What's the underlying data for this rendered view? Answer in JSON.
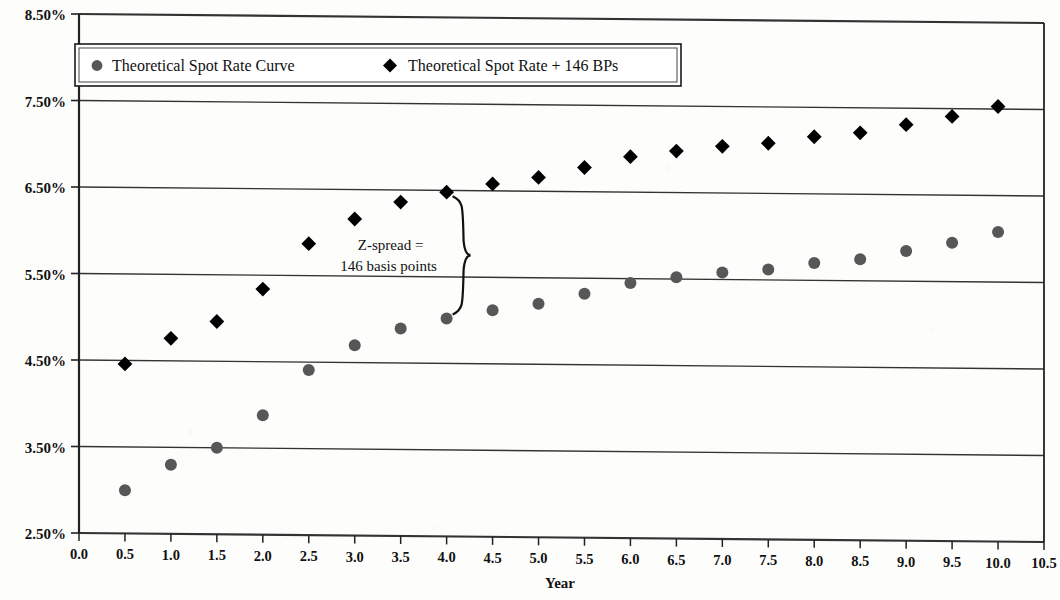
{
  "chart_data": {
    "type": "scatter",
    "title": "",
    "xlabel": "Year",
    "ylabel": "",
    "xlim": [
      0.0,
      10.5
    ],
    "ylim": [
      2.5,
      8.5
    ],
    "grid": true,
    "legend_position": "top-left-inside",
    "x": [
      0.5,
      1.0,
      1.5,
      2.0,
      2.5,
      3.0,
      3.5,
      4.0,
      4.5,
      5.0,
      5.5,
      6.0,
      6.5,
      7.0,
      7.5,
      8.0,
      8.5,
      9.0,
      9.5,
      10.0
    ],
    "x_tick_labels": [
      "0.0",
      "0.5",
      "1.0",
      "1.5",
      "2.0",
      "2.5",
      "3.0",
      "3.5",
      "4.0",
      "4.5",
      "5.0",
      "5.5",
      "6.0",
      "6.5",
      "7.0",
      "7.5",
      "8.0",
      "8.5",
      "9.0",
      "9.5",
      "10.0",
      "10.5"
    ],
    "x_ticks": [
      0.0,
      0.5,
      1.0,
      1.5,
      2.0,
      2.5,
      3.0,
      3.5,
      4.0,
      4.5,
      5.0,
      5.5,
      6.0,
      6.5,
      7.0,
      7.5,
      8.0,
      8.5,
      9.0,
      9.5,
      10.0,
      10.5
    ],
    "y_tick_labels": [
      "8.50%",
      "7.50%",
      "6.50%",
      "5.50%",
      "4.50%",
      "3.50%",
      "2.50%"
    ],
    "y_ticks": [
      8.5,
      7.5,
      6.5,
      5.5,
      4.5,
      3.5,
      2.5
    ],
    "series": [
      {
        "name": "Theoretical Spot Rate Curve",
        "marker": "circle",
        "color": "#575757",
        "values": [
          3.0,
          3.3,
          3.5,
          3.88,
          4.41,
          4.7,
          4.9,
          5.02,
          5.12,
          5.2,
          5.32,
          5.45,
          5.52,
          5.58,
          5.62,
          5.7,
          5.75,
          5.85,
          5.95,
          6.08
        ]
      },
      {
        "name": "Theoretical Spot Rate + 146 BPs",
        "marker": "diamond",
        "color": "#000000",
        "values": [
          4.46,
          4.76,
          4.96,
          5.34,
          5.87,
          6.16,
          6.36,
          6.48,
          6.58,
          6.66,
          6.78,
          6.91,
          6.98,
          7.04,
          7.08,
          7.16,
          7.21,
          7.31,
          7.41,
          7.53
        ]
      }
    ],
    "annotation": {
      "line1": "Z-spread =",
      "line2": "146 basis points",
      "brace_at_x": 4.0,
      "brace_top_value": 6.48,
      "brace_bottom_value": 5.02,
      "spread_bps": 146
    }
  },
  "legend": {
    "items": [
      {
        "label": "Theoretical Spot Rate Curve",
        "marker": "circle",
        "color": "#575757"
      },
      {
        "label": "Theoretical Spot Rate + 146 BPs",
        "marker": "diamond",
        "color": "#000000"
      }
    ]
  },
  "axis": {
    "x_title": "Year"
  },
  "colors": {
    "background": "#fdfdfc",
    "axis": "#222222",
    "gridline": "#333333",
    "series_spot": "#575757",
    "series_spread": "#000000"
  }
}
